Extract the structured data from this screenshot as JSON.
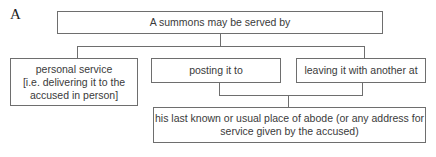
{
  "figure_label": "A",
  "root": {
    "text": "A summons may be served by"
  },
  "methods": [
    {
      "text": "personal service [i.e. delivering it to the accused in person]",
      "line1": "personal service",
      "line2": "[i.e. delivering it to the",
      "line3": "accused in person]"
    },
    {
      "text": "posting it to"
    },
    {
      "text": "leaving it with another at"
    }
  ],
  "destination": {
    "line1": "his last known or usual place of abode (or any address for",
    "line2": "service given by the accused)"
  },
  "colors": {
    "border": "#6e6e6e",
    "text": "#3a3a3a",
    "background": "#ffffff"
  }
}
